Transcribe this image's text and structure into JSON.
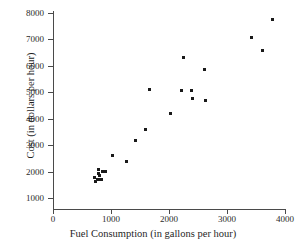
{
  "chart_data": {
    "type": "scatter",
    "title": "",
    "xlabel": "Fuel Consumption (in gallons per hour)",
    "ylabel": "Cost (in dollars per hour)",
    "xlim": [
      0,
      4000
    ],
    "ylim": [
      1000,
      8000
    ],
    "xticks": [
      0,
      1000,
      2000,
      3000,
      4000
    ],
    "yticks": [
      1000,
      2000,
      3000,
      4000,
      5000,
      6000,
      7000,
      8000
    ],
    "xtick_labels": [
      "0",
      "1000",
      "2000",
      "3000",
      "4000"
    ],
    "ytick_labels": [
      "1000",
      "2000",
      "3000",
      "4000",
      "5000",
      "6000",
      "7000",
      "8000"
    ],
    "grid": false,
    "legend": false,
    "marker": "square",
    "marker_color": "#1a1a1a",
    "points": [
      {
        "x": 710,
        "y": 1790
      },
      {
        "x": 725,
        "y": 1640
      },
      {
        "x": 760,
        "y": 1700
      },
      {
        "x": 780,
        "y": 2060
      },
      {
        "x": 790,
        "y": 1930
      },
      {
        "x": 795,
        "y": 1700
      },
      {
        "x": 810,
        "y": 1860
      },
      {
        "x": 830,
        "y": 1700
      },
      {
        "x": 845,
        "y": 2010
      },
      {
        "x": 875,
        "y": 1990
      },
      {
        "x": 900,
        "y": 2010
      },
      {
        "x": 1020,
        "y": 2620
      },
      {
        "x": 1260,
        "y": 2380
      },
      {
        "x": 1420,
        "y": 3180
      },
      {
        "x": 1600,
        "y": 3610
      },
      {
        "x": 1660,
        "y": 5100
      },
      {
        "x": 2030,
        "y": 4180
      },
      {
        "x": 2210,
        "y": 5070
      },
      {
        "x": 2250,
        "y": 6320
      },
      {
        "x": 2390,
        "y": 5070
      },
      {
        "x": 2400,
        "y": 4750
      },
      {
        "x": 2620,
        "y": 5850
      },
      {
        "x": 2630,
        "y": 4680
      },
      {
        "x": 3430,
        "y": 7060
      },
      {
        "x": 3620,
        "y": 6570
      },
      {
        "x": 3780,
        "y": 7770
      }
    ]
  }
}
